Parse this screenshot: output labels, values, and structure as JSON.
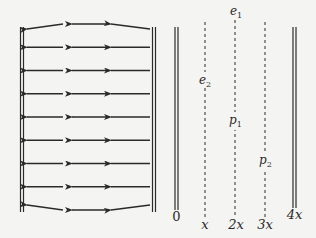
{
  "diagram": {
    "field_direction": "left",
    "arrow_rows": 9,
    "arrows_per_row": 3,
    "colors": {
      "ink": "#2a2a2a",
      "background": "#f4f4f2"
    },
    "plate_labels": {
      "zero": "0",
      "four_x": "4x"
    },
    "position_labels": [
      {
        "text": "x",
        "key": "x"
      },
      {
        "text": "2x",
        "key": "2x"
      },
      {
        "text": "3x",
        "key": "3x"
      }
    ],
    "point_labels": {
      "e1": {
        "base": "e",
        "sub": "1"
      },
      "e2": {
        "base": "e",
        "sub": "2"
      },
      "p1": {
        "base": "p",
        "sub": "1"
      },
      "p2": {
        "base": "p",
        "sub": "2"
      }
    }
  }
}
